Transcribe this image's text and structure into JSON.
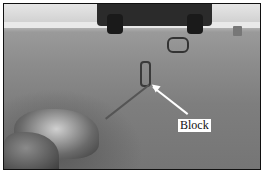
{
  "figure": {
    "annotation_label": "Block",
    "caption": ""
  },
  "colors": {
    "frame": "#111111",
    "label_bg": "#ffffff",
    "arrow": "#ffffff"
  }
}
